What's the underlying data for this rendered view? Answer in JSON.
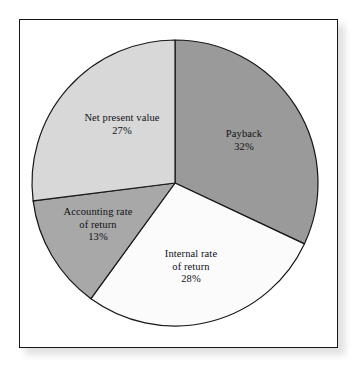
{
  "figure": {
    "background_color": "#ffffff",
    "frame_border_color": "#16161a"
  },
  "chart_data": {
    "type": "pie",
    "title": "",
    "subtitle": "",
    "xlabel": "",
    "ylabel": "",
    "legend_position": "none",
    "grid": false,
    "labels_inside_slices": true,
    "start_angle_deg": 0,
    "direction": "clockwise",
    "units": "percent",
    "categories": [
      "Payback",
      "Internal rate of return",
      "Accounting rate of return",
      "Net present value"
    ],
    "values": [
      32,
      28,
      13,
      27
    ],
    "slices": [
      {
        "name": "Payback",
        "label_line1": "Payback",
        "label_line2": "",
        "value": 32,
        "value_text": "32%",
        "color": "#9a9a9a",
        "start_angle_deg": 0,
        "end_angle_deg": 115.2
      },
      {
        "name": "Internal rate of return",
        "label_line1": "Internal rate",
        "label_line2": "of return",
        "value": 28,
        "value_text": "28%",
        "color": "#fbfbfb",
        "start_angle_deg": 115.2,
        "end_angle_deg": 216.0
      },
      {
        "name": "Accounting rate of return",
        "label_line1": "Accounting rate",
        "label_line2": "of return",
        "value": 13,
        "value_text": "13%",
        "color": "#a8a8a8",
        "start_angle_deg": 216.0,
        "end_angle_deg": 262.8
      },
      {
        "name": "Net present value",
        "label_line1": "Net present value",
        "label_line2": "",
        "value": 27,
        "value_text": "27%",
        "color": "#d8d8d8",
        "start_angle_deg": 262.8,
        "end_angle_deg": 360.0
      }
    ]
  }
}
